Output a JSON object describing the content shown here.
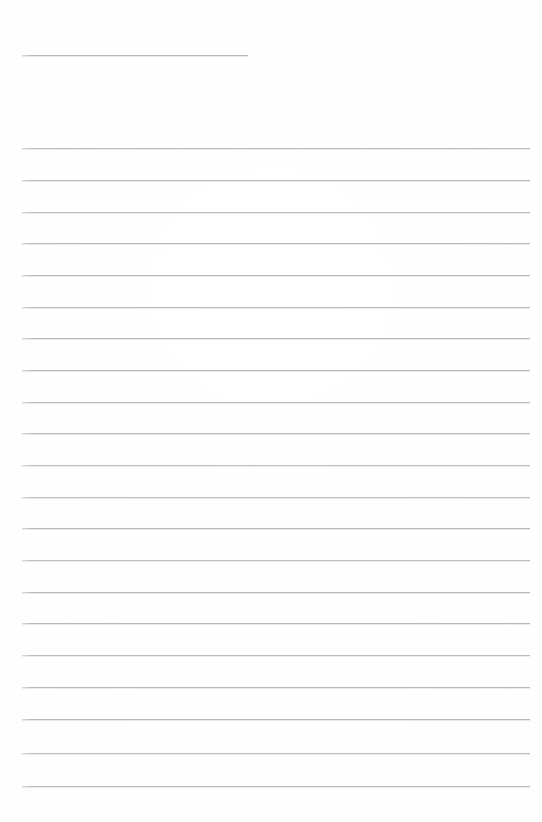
{
  "document": {
    "kind": "scanned-lined-paper",
    "title_line_present": true,
    "background_color": "#ffffff",
    "rule_color": "#b4b5b7",
    "rule_thickness_px": 1,
    "page_width_px": 542,
    "page_height_px": 822,
    "text_content": "",
    "has_handwriting": false,
    "has_printed_text": false
  },
  "layout": {
    "left_margin_px": 22,
    "right_margin_px": 12,
    "content_width_px": 508,
    "first_rule_y_px": 148,
    "rule_spacing_px": 31.8,
    "rule_count": 21
  },
  "title_rule": {
    "name": "name-date-rule",
    "x_px": 22,
    "y_px": 55,
    "width_px": 226,
    "color": "#b0b1b3"
  },
  "rules": [
    {
      "index": 1,
      "y_px": 148
    },
    {
      "index": 2,
      "y_px": 180
    },
    {
      "index": 3,
      "y_px": 212
    },
    {
      "index": 4,
      "y_px": 243
    },
    {
      "index": 5,
      "y_px": 275
    },
    {
      "index": 6,
      "y_px": 307
    },
    {
      "index": 7,
      "y_px": 338
    },
    {
      "index": 8,
      "y_px": 370
    },
    {
      "index": 9,
      "y_px": 402
    },
    {
      "index": 10,
      "y_px": 433
    },
    {
      "index": 11,
      "y_px": 465
    },
    {
      "index": 12,
      "y_px": 497
    },
    {
      "index": 13,
      "y_px": 528
    },
    {
      "index": 14,
      "y_px": 560
    },
    {
      "index": 15,
      "y_px": 592
    },
    {
      "index": 16,
      "y_px": 623
    },
    {
      "index": 17,
      "y_px": 655
    },
    {
      "index": 18,
      "y_px": 687
    },
    {
      "index": 19,
      "y_px": 719
    },
    {
      "index": 20,
      "y_px": 753
    },
    {
      "index": 21,
      "y_px": 786
    }
  ],
  "artifacts": [
    {
      "name": "scan-speck",
      "x_px": 27,
      "y_px": 1,
      "width_px": 7,
      "height_px": 6
    }
  ]
}
